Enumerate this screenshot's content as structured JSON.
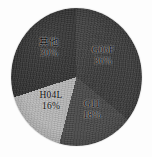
{
  "chart_data": {
    "type": "pie",
    "title": "",
    "subtitle": "",
    "xlabel": "",
    "ylabel": "",
    "grid": false,
    "legend": "none",
    "labels_inside": true,
    "start_angle_deg": 0,
    "direction": "clockwise",
    "categories": [
      "G06F",
      "G11",
      "H04L",
      "其他"
    ],
    "values": [
      36,
      18,
      16,
      30
    ],
    "value_unit": "%",
    "colors": [
      "#3c3c3c",
      "#4a4a4a",
      "#b9b9b9",
      "#2f2f2f"
    ],
    "slices": [
      {
        "name": "G06F",
        "percent": 36,
        "percent_label": "36%",
        "color": "#3c3c3c",
        "start_deg": 0,
        "end_deg": 129.6
      },
      {
        "name": "G11",
        "percent": 18,
        "percent_label": "18%",
        "color": "#4a4a4a",
        "start_deg": 129.6,
        "end_deg": 194.4
      },
      {
        "name": "H04L",
        "percent": 16,
        "percent_label": "16%",
        "color": "#b9b9b9",
        "start_deg": 194.4,
        "end_deg": 252.0
      },
      {
        "name": "其他",
        "percent": 30,
        "percent_label": "30%",
        "color": "#2f2f2f",
        "start_deg": 252.0,
        "end_deg": 360.0
      }
    ]
  },
  "figure": {
    "background": "#fdfdfd",
    "outline_color": "#6b6b6b"
  },
  "labels": {
    "other": {
      "name": "其他",
      "percent": "30%"
    },
    "g06f": {
      "name": "G06F",
      "percent": "36%"
    },
    "h04l": {
      "name": "H04L",
      "percent": "16%"
    },
    "g11": {
      "name": "G11",
      "percent": "18%"
    }
  }
}
